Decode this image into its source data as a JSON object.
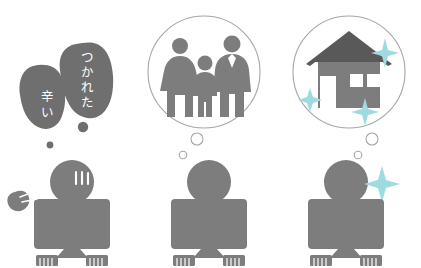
{
  "heading": {
    "text": "ストレスを抱えた人でも家族も家も手に入る"
  },
  "colors": {
    "figure_gray": "#7d7d7d",
    "blob_gray": "#6f6f6f",
    "roof_dark": "#595959",
    "house_wall": "#7d7d7d",
    "circle_stroke": "#a6a6a6",
    "sparkle_cyan": "#9ddbe0",
    "white": "#ffffff",
    "background": "#ffffff"
  },
  "scene": {
    "title": "three-seated-figures-illustration",
    "panels": [
      {
        "id": "panel-stressed",
        "label": "stressed-worker",
        "thought_type": "speech-blobs",
        "bubbles": [
          {
            "id": "blob-tsurai",
            "text": "辛い",
            "orientation": "vertical"
          },
          {
            "id": "blob-tsukareta",
            "text": "つかれた",
            "orientation": "vertical"
          }
        ],
        "figure": {
          "sweat_marks": 3,
          "impact_mark": "stress-burst"
        }
      },
      {
        "id": "panel-family",
        "label": "dreaming-of-family",
        "thought_type": "thought-circle",
        "icon": "family-of-three-icon",
        "icon_members": [
          "mother",
          "child",
          "father"
        ]
      },
      {
        "id": "panel-house",
        "label": "dreaming-of-house",
        "thought_type": "thought-circle",
        "icon": "house-icon",
        "sparkle_count": 4
      }
    ]
  }
}
